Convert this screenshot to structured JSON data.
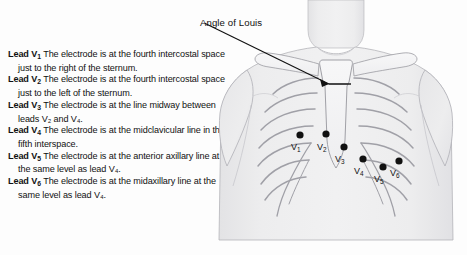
{
  "figure": {
    "annotation": {
      "label": "Angle of Louis"
    },
    "electrodes": [
      {
        "name": "V1",
        "label": "V",
        "sub": "1",
        "dot": {
          "x": 95,
          "y": 135
        },
        "text": {
          "x": 86,
          "y": 150
        }
      },
      {
        "name": "V2",
        "label": "V",
        "sub": "2",
        "dot": {
          "x": 121,
          "y": 134
        },
        "text": {
          "x": 112,
          "y": 150
        }
      },
      {
        "name": "V3",
        "label": "V",
        "sub": "3",
        "dot": {
          "x": 139,
          "y": 147
        },
        "text": {
          "x": 130,
          "y": 162
        }
      },
      {
        "name": "V4",
        "label": "V",
        "sub": "4",
        "dot": {
          "x": 158,
          "y": 159
        },
        "text": {
          "x": 149,
          "y": 174
        }
      },
      {
        "name": "V5",
        "label": "V",
        "sub": "5",
        "dot": {
          "x": 178,
          "y": 167
        },
        "text": {
          "x": 169,
          "y": 182
        }
      },
      {
        "name": "V6",
        "label": "V",
        "sub": "6",
        "dot": {
          "x": 194,
          "y": 161
        },
        "text": {
          "x": 185,
          "y": 176
        }
      }
    ],
    "colors": {
      "skin": "#ededee",
      "skin_shadow": "#e2e2e4",
      "bone": "#f4f4f5",
      "outline": "#8d8d92",
      "ink": "#111111"
    }
  },
  "legend": {
    "entries": [
      {
        "lead": "Lead V",
        "sub": "1",
        "text": "The electrode is at the fourth intercostal space just to the right of the sternum."
      },
      {
        "lead": "Lead V",
        "sub": "2",
        "text": "The electrode is at the fourth intercostal space just to the left of the sternum."
      },
      {
        "lead": "Lead V",
        "sub": "3",
        "text": "The electrode is at the line midway between leads V₂ and V₄."
      },
      {
        "lead": "Lead V",
        "sub": "4",
        "text": "The electrode is at the midclavicular line in the fifth interspace."
      },
      {
        "lead": "Lead V",
        "sub": "5",
        "text": "The electrode is at the anterior axillary line at the same level as lead V₄."
      },
      {
        "lead": "Lead V",
        "sub": "6",
        "text": "The electrode is at the midaxillary line at the same level as lead V₄."
      }
    ]
  }
}
